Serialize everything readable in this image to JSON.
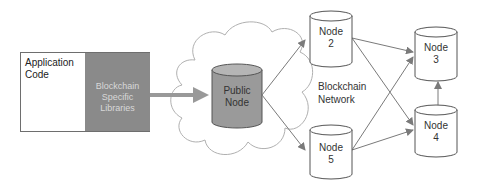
{
  "application": {
    "code_label": "Application Code",
    "library_label": "Blockchain Specific Libraries"
  },
  "public_node": {
    "label_line1": "Public",
    "label_line2": "Node"
  },
  "network": {
    "label_line1": "Blockchain",
    "label_line2": "Network"
  },
  "nodes": [
    {
      "id": "2",
      "line1": "Node",
      "line2": "2"
    },
    {
      "id": "3",
      "line1": "Node",
      "line2": "3"
    },
    {
      "id": "4",
      "line1": "Node",
      "line2": "4"
    },
    {
      "id": "5",
      "line1": "Node",
      "line2": "5"
    }
  ],
  "colors": {
    "library_fill": "#8a8a8a",
    "public_node_fill": "#9a9a9a",
    "node_fill": "#ffffff",
    "arrow": "#7a7a7a",
    "thick_arrow": "#999999"
  }
}
